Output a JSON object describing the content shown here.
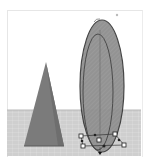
{
  "app": {
    "view": "3D workplane viewport"
  },
  "scene": {
    "background_color": "#ffffff",
    "floor_color": "#c8c8c8",
    "grid_line_color": "#dadada",
    "objects": [
      {
        "name": "pyramid",
        "fill": "#7a7a7a",
        "selected": false
      },
      {
        "name": "ellipsoid",
        "fill": "#8f8f8f",
        "outline": "#3a3a3a",
        "selected": true
      }
    ],
    "selection": {
      "handle_count": 4,
      "handle_color": "#ffffff",
      "handle_stroke": "#222222",
      "rotate_marker": "↻"
    }
  }
}
